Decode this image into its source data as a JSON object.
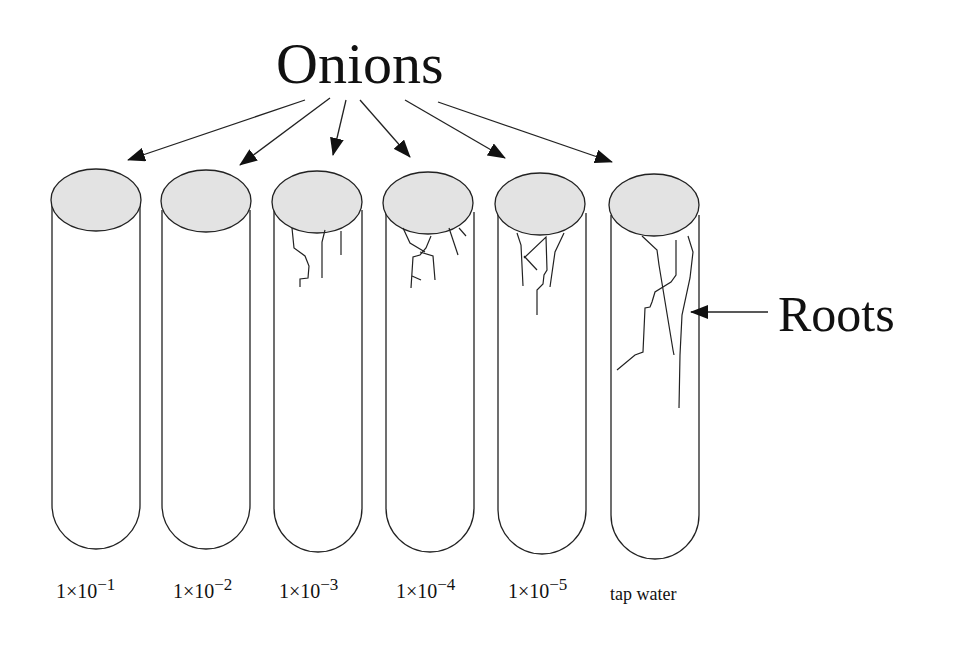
{
  "diagram": {
    "title": "Onions",
    "root_label": "Roots",
    "tubes": [
      {
        "id": "tube-1",
        "label_base": "1×10",
        "label_exp": "−1",
        "has_roots": false
      },
      {
        "id": "tube-2",
        "label_base": "1×10",
        "label_exp": "−2",
        "has_roots": false
      },
      {
        "id": "tube-3",
        "label_base": "1×10",
        "label_exp": "−3",
        "has_roots": true
      },
      {
        "id": "tube-4",
        "label_base": "1×10",
        "label_exp": "−4",
        "has_roots": true
      },
      {
        "id": "tube-5",
        "label_base": "1×10",
        "label_exp": "−5",
        "has_roots": true
      },
      {
        "id": "tube-6",
        "label": "tap water",
        "has_roots": true
      }
    ],
    "colors": {
      "line": "#222222",
      "onion_fill": "#e3e3e3",
      "background": "#ffffff"
    }
  }
}
